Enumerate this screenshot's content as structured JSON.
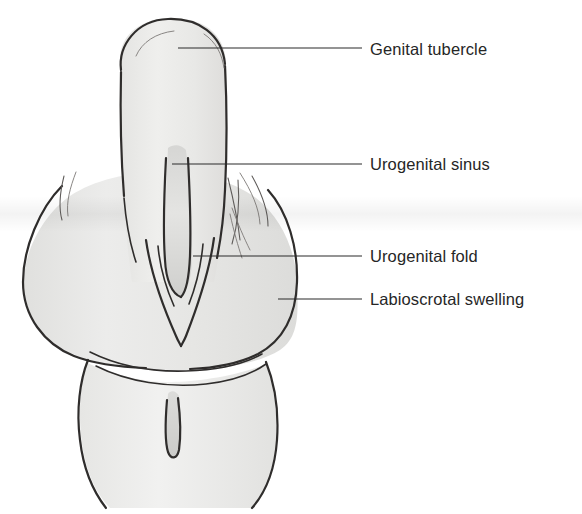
{
  "figure": {
    "kind": "anatomical-line-drawing",
    "background_color": "#ffffff",
    "ink_color": "#2f2d2c",
    "fill_color": "#e9e9e7",
    "label_color": "#262626"
  },
  "bleed_through": {
    "visible": true,
    "top_fragment": "",
    "mid_fragment": ""
  },
  "labels": [
    {
      "id": "genital-tubercle",
      "text": "Genital tubercle",
      "text_x": 370,
      "text_y": 55,
      "leader_start_x": 178,
      "leader_start_y": 48,
      "leader_end_x": 362,
      "leader_end_y": 48
    },
    {
      "id": "urogenital-sinus",
      "text": "Urogenital sinus",
      "text_x": 370,
      "text_y": 170,
      "leader_start_x": 172,
      "leader_start_y": 164,
      "leader_end_x": 362,
      "leader_end_y": 164
    },
    {
      "id": "urogenital-fold",
      "text": "Urogenital fold",
      "text_x": 370,
      "text_y": 262,
      "leader_start_x": 193,
      "leader_start_y": 256,
      "leader_end_x": 362,
      "leader_end_y": 256
    },
    {
      "id": "labioscrotal-swelling",
      "text": "Labioscrotal swelling",
      "text_x": 370,
      "text_y": 305,
      "leader_start_x": 278,
      "leader_start_y": 299,
      "leader_end_x": 362,
      "leader_end_y": 299
    }
  ],
  "structures": [
    {
      "id": "genital-tubercle",
      "name": "Genital tubercle"
    },
    {
      "id": "urogenital-sinus",
      "name": "Urogenital sinus"
    },
    {
      "id": "urogenital-fold",
      "name": "Urogenital fold"
    },
    {
      "id": "labioscrotal-swelling",
      "name": "Labioscrotal swelling"
    },
    {
      "id": "perineum-tail",
      "name": "Perineum and tail region"
    },
    {
      "id": "anal-slit",
      "name": "Anal membrane slit"
    }
  ]
}
